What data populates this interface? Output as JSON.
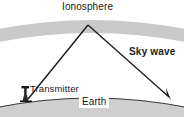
{
  "diagram": {
    "labels": {
      "ionosphere": "Ionosphere",
      "sky_wave": "Sky wave",
      "transmitter": "Transmitter",
      "earth": "Earth"
    },
    "icons": {
      "transmitter": "antenna-tower-icon",
      "arrow": "arrowhead-icon"
    },
    "colors": {
      "ionosphere_band": "#c9c9c9",
      "earth_fill": "#cfcfcf",
      "ray_line": "#1a1a1a",
      "background": "#ffffff",
      "text": "#1a1a1a"
    },
    "geometry": {
      "ionosphere_band_thickness": 13,
      "ray_apex": [
        88,
        24
      ],
      "transmitter_point": [
        27,
        99
      ],
      "receiver_point": [
        170,
        99
      ]
    }
  }
}
